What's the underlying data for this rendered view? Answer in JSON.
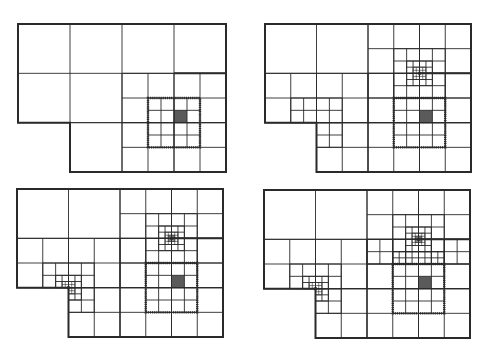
{
  "figure": {
    "line_color": "#2a2a2a",
    "shade_color": "#5a5a5a",
    "domain_outline": [
      [
        0,
        0
      ],
      [
        4,
        0
      ],
      [
        4,
        3
      ],
      [
        1,
        3
      ],
      [
        1,
        2
      ],
      [
        0,
        2
      ]
    ],
    "panels": [
      {
        "id": "stage-1",
        "origin": [
          18,
          24
        ],
        "size": [
          208,
          148
        ],
        "patches": [
          [
            0,
            0,
            4,
            2,
            1
          ],
          [
            1,
            2,
            4,
            3,
            1
          ],
          [
            2,
            1,
            4,
            3,
            0.5
          ],
          [
            2.5,
            1.5,
            3.5,
            2.5,
            0.25
          ]
        ],
        "dotted_boxes": [
          [
            2.5,
            1.5,
            3.5,
            2.5
          ]
        ],
        "shaded": [
          [
            3.0,
            1.75,
            0.25
          ]
        ],
        "thick_segments": [
          [
            3,
            1,
            4,
            1
          ]
        ]
      },
      {
        "id": "stage-2",
        "origin": [
          265,
          24
        ],
        "size": [
          206,
          148
        ],
        "patches": [
          [
            0,
            0,
            4,
            2,
            1
          ],
          [
            1,
            2,
            4,
            3,
            1
          ],
          [
            2,
            0,
            4,
            2,
            0.5
          ],
          [
            2,
            1,
            4,
            3,
            0.5
          ],
          [
            2.5,
            1.5,
            3.5,
            2.5,
            0.25
          ],
          [
            2.5,
            0.5,
            3.5,
            1.5,
            0.25
          ],
          [
            2.75,
            0.75,
            3.25,
            1.25,
            0.125
          ],
          [
            2.875,
            0.875,
            3.125,
            1.125,
            0.0625
          ],
          [
            0,
            1,
            2,
            2,
            0.5
          ],
          [
            1,
            2,
            2,
            3,
            0.5
          ],
          [
            0.5,
            1.5,
            1.5,
            2,
            0.25
          ],
          [
            1,
            2,
            1.5,
            2.5,
            0.25
          ]
        ],
        "dotted_boxes": [
          [
            2.5,
            1.5,
            3.5,
            2.5
          ]
        ],
        "shaded": [
          [
            3.0,
            1.75,
            0.25
          ],
          [
            2.96875,
            0.96875,
            0.0625
          ]
        ],
        "thick_segments": [
          [
            3,
            1,
            4,
            1
          ]
        ]
      },
      {
        "id": "stage-3",
        "origin": [
          17,
          189
        ],
        "size": [
          206,
          148
        ],
        "patches": [
          [
            0,
            0,
            4,
            2,
            1
          ],
          [
            1,
            2,
            4,
            3,
            1
          ],
          [
            2,
            0,
            4,
            2,
            0.5
          ],
          [
            2,
            1,
            4,
            3,
            0.5
          ],
          [
            2.5,
            1.5,
            3.5,
            2.5,
            0.25
          ],
          [
            2.5,
            0.5,
            3.5,
            1.5,
            0.25
          ],
          [
            2.75,
            0.75,
            3.25,
            1.25,
            0.125
          ],
          [
            2.875,
            0.875,
            3.125,
            1.125,
            0.0625
          ],
          [
            2.9375,
            0.9375,
            3.0625,
            1.0625,
            0.03125
          ],
          [
            0,
            1,
            2,
            2,
            0.5
          ],
          [
            1,
            2,
            2,
            3,
            0.5
          ],
          [
            0.5,
            1.5,
            1.5,
            2,
            0.25
          ],
          [
            1,
            2,
            1.5,
            2.5,
            0.25
          ],
          [
            0.75,
            1.75,
            1.25,
            2,
            0.125
          ],
          [
            1,
            2,
            1.25,
            2.25,
            0.125
          ],
          [
            0.875,
            1.875,
            1.125,
            2,
            0.0625
          ],
          [
            1,
            2,
            1.125,
            2.125,
            0.0625
          ]
        ],
        "dotted_boxes": [
          [
            2.5,
            1.5,
            3.5,
            2.5
          ]
        ],
        "shaded": [
          [
            3.0,
            1.75,
            0.25
          ],
          [
            2.96875,
            0.96875,
            0.0625
          ],
          [
            0.96875,
            1.96875,
            0.0625
          ]
        ],
        "thick_segments": [
          [
            3,
            1,
            4,
            1
          ]
        ]
      },
      {
        "id": "stage-4",
        "origin": [
          264,
          190
        ],
        "size": [
          206,
          148
        ],
        "patches": [
          [
            0,
            0,
            4,
            2,
            1
          ],
          [
            1,
            2,
            4,
            3,
            1
          ],
          [
            2,
            0,
            4,
            2,
            0.5
          ],
          [
            2,
            1,
            4,
            3,
            0.5
          ],
          [
            2.5,
            1.5,
            3.5,
            2.5,
            0.25
          ],
          [
            2.5,
            0.5,
            3.5,
            1.5,
            0.25
          ],
          [
            2,
            1,
            4,
            1.5,
            0.25
          ],
          [
            2.5,
            1.25,
            3.5,
            1.5,
            0.125
          ],
          [
            2.75,
            0.75,
            3.25,
            1.25,
            0.125
          ],
          [
            2.875,
            0.875,
            3.125,
            1.125,
            0.0625
          ],
          [
            2.9375,
            0.9375,
            3.0625,
            1.0625,
            0.03125
          ],
          [
            0,
            1,
            2,
            2,
            0.5
          ],
          [
            1,
            2,
            2,
            3,
            0.5
          ],
          [
            0.5,
            1.5,
            1.5,
            2,
            0.25
          ],
          [
            1,
            2,
            1.5,
            2.5,
            0.25
          ],
          [
            0.75,
            1.75,
            1.25,
            2,
            0.125
          ],
          [
            1,
            2,
            1.25,
            2.25,
            0.125
          ],
          [
            0.875,
            1.875,
            1.125,
            2,
            0.0625
          ],
          [
            1,
            2,
            1.125,
            2.125,
            0.0625
          ]
        ],
        "dotted_boxes": [
          [
            2.5,
            1.5,
            3.5,
            2.5
          ]
        ],
        "shaded": [
          [
            3.0,
            1.75,
            0.25
          ],
          [
            2.96875,
            0.96875,
            0.0625
          ],
          [
            0.96875,
            1.96875,
            0.0625
          ]
        ],
        "thick_segments": [
          [
            3,
            1,
            4,
            1
          ]
        ]
      }
    ]
  }
}
